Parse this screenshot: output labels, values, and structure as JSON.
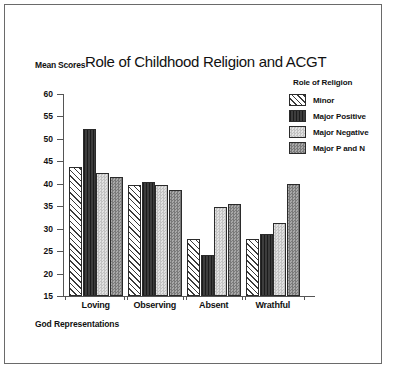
{
  "figure": {
    "title": "Role of Childhood Religion and ACGT",
    "y_axis_caption": "Mean Scores",
    "x_axis_caption": "God Representations",
    "legend_title": "Role of Religion"
  },
  "chart_data": {
    "type": "bar",
    "title": "Role of Childhood Religion and ACGT",
    "xlabel": "God Representations",
    "ylabel": "Mean Scores",
    "ylim": [
      15,
      60
    ],
    "yticks": [
      15,
      20,
      25,
      30,
      35,
      40,
      45,
      50,
      55,
      60
    ],
    "grid": false,
    "legend_position": "top-right",
    "categories": [
      "Loving",
      "Observing",
      "Absent",
      "Wrathful"
    ],
    "series": [
      {
        "name": "Minor",
        "values": [
          43.8,
          39.8,
          27.7,
          27.6
        ],
        "fill": "diagonal-hatch",
        "color": "#ffffff"
      },
      {
        "name": "Major Positive",
        "values": [
          52.3,
          40.3,
          24.2,
          28.8
        ],
        "fill": "solid-dark",
        "color": "#2e2e2e"
      },
      {
        "name": "Major Negative",
        "values": [
          42.4,
          39.8,
          34.9,
          31.3
        ],
        "fill": "light-check",
        "color": "#d2d2d2"
      },
      {
        "name": "Major P and N",
        "values": [
          41.5,
          38.7,
          35.6,
          40.0
        ],
        "fill": "medium-check",
        "color": "#8f8f8f"
      }
    ]
  }
}
